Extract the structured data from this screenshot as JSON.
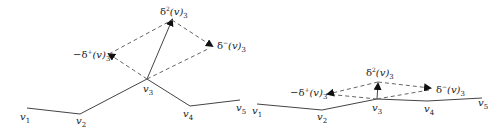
{
  "diagrams": [
    {
      "id": "large-curvature",
      "vertices": [
        {
          "name": "v1",
          "label": "v",
          "sub": "1"
        },
        {
          "name": "v2",
          "label": "v",
          "sub": "2"
        },
        {
          "name": "v3",
          "label": "v",
          "sub": "3"
        },
        {
          "name": "v4",
          "label": "v",
          "sub": "4"
        },
        {
          "name": "v5",
          "label": "v",
          "sub": "5"
        }
      ],
      "vectors": {
        "second_diff": {
          "pre": "δ",
          "sup": "2",
          "mid": "(v)",
          "sub": "3"
        },
        "neg_forward": {
          "pre": "−δ",
          "sup": "+",
          "mid": "(v)",
          "sub": "3"
        },
        "backward": {
          "pre": "δ",
          "sup": "−",
          "mid": "(v)",
          "sub": "3"
        }
      }
    },
    {
      "id": "small-curvature",
      "vertices": [
        {
          "name": "v1",
          "label": "v",
          "sub": "1"
        },
        {
          "name": "v2",
          "label": "v",
          "sub": "2"
        },
        {
          "name": "v3",
          "label": "v",
          "sub": "3"
        },
        {
          "name": "v4",
          "label": "v",
          "sub": "4"
        },
        {
          "name": "v5",
          "label": "v",
          "sub": "5"
        }
      ],
      "vectors": {
        "second_diff": {
          "pre": "δ",
          "sup": "2",
          "mid": "(v)",
          "sub": "3"
        },
        "neg_forward": {
          "pre": "−δ",
          "sup": "+",
          "mid": "(v)",
          "sub": "3"
        },
        "backward": {
          "pre": "δ",
          "sup": "−",
          "mid": "(v)",
          "sub": "3"
        }
      }
    }
  ],
  "colors": {
    "line": "#444444",
    "dash": "#666666",
    "text": "#222222"
  }
}
